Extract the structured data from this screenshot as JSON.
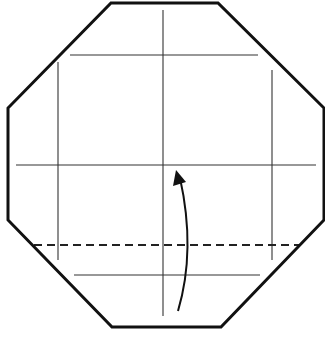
{
  "diagram": {
    "type": "origami-fold-step",
    "canvas": {
      "width": 325,
      "height": 343
    },
    "colors": {
      "outline": "#111111",
      "crease": "#333333",
      "dashed": "#222222",
      "arrow": "#111111",
      "background": "#ffffff"
    },
    "octagon": {
      "points": [
        [
          111,
          3
        ],
        [
          218,
          3
        ],
        [
          324,
          108
        ],
        [
          324,
          220
        ],
        [
          221,
          327
        ],
        [
          112,
          327
        ],
        [
          8,
          220
        ],
        [
          8,
          108
        ]
      ]
    },
    "crease_lines": {
      "horizontal": [
        {
          "name": "upper-horizontal-crease",
          "x1": 70,
          "y1": 55,
          "x2": 258,
          "y2": 55
        },
        {
          "name": "middle-horizontal-crease",
          "x1": 16,
          "y1": 165,
          "x2": 316,
          "y2": 165
        },
        {
          "name": "lower-horizontal-crease",
          "x1": 74,
          "y1": 275,
          "x2": 260,
          "y2": 275
        }
      ],
      "vertical": [
        {
          "name": "left-vertical-crease",
          "x1": 58,
          "y1": 62,
          "x2": 58,
          "y2": 260
        },
        {
          "name": "center-vertical-crease",
          "x1": 163,
          "y1": 10,
          "x2": 163,
          "y2": 316
        },
        {
          "name": "right-vertical-crease",
          "x1": 272,
          "y1": 70,
          "x2": 272,
          "y2": 260
        }
      ]
    },
    "valley_fold": {
      "x1": 34,
      "y1": 245,
      "x2": 300,
      "y2": 245,
      "dash": "8,5"
    },
    "fold_arrow": {
      "path": "M 178 311 Q 196 250 180 178",
      "head": [
        [
          176,
          170
        ],
        [
          173,
          186
        ],
        [
          186,
          182
        ]
      ],
      "direction": "up"
    }
  }
}
